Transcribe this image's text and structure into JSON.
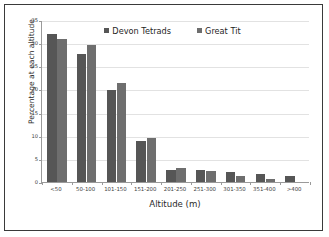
{
  "chart_data": {
    "type": "bar",
    "title": "",
    "xlabel": "Altitude (m)",
    "ylabel": "Percentage at each altitude",
    "categories": [
      "<50",
      "50-100",
      "101-150",
      "151-200",
      "201-250",
      "251-300",
      "301-350",
      "351-400",
      ">400"
    ],
    "series": [
      {
        "name": "Devon Tetrads",
        "color": "#565656",
        "values": [
          31.9,
          27.6,
          19.9,
          8.9,
          2.7,
          2.7,
          2.1,
          1.7,
          1.4
        ]
      },
      {
        "name": "Great Tit",
        "color": "#6e6e6e",
        "values": [
          30.9,
          29.6,
          21.4,
          9.6,
          3.0,
          2.4,
          1.35,
          0.7,
          0.0
        ]
      }
    ],
    "ylim": [
      0,
      35
    ],
    "yticks": [
      0,
      5,
      10,
      15,
      20,
      25,
      30,
      35
    ],
    "ytick_labels": [
      "0",
      "5",
      "10",
      "15",
      "20",
      "25",
      "30",
      "35"
    ],
    "grid": true,
    "grid_axis": "y",
    "legend_position": "top-center"
  },
  "legend": {
    "entries": [
      {
        "label": "Devon Tetrads"
      },
      {
        "label": "Great Tit"
      }
    ]
  }
}
